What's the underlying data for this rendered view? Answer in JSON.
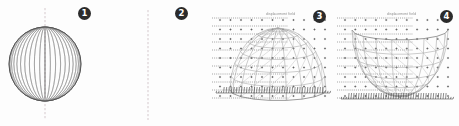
{
  "figure": {
    "title": "Four-panel geometry figure: spheres and mesh surfaces",
    "background_color": "#fdfdfd",
    "line_color": "#8a8a8a",
    "dark_line_color": "#4a4a4a",
    "axis_color": "#b5a9ad",
    "badge_color": "#2b2b2b",
    "badge_text_color": "#ffffff",
    "width": 459,
    "height": 126
  },
  "panels": [
    {
      "number": "1",
      "badge_label": "❶",
      "name": "sphere-meridians",
      "description": "Sphere drawn with vertical meridian (longitude) lines and a dashed vertical polar axis",
      "geometry": {
        "type": "sphere-meridians",
        "center_x": 45,
        "center_y": 64,
        "radius_x": 36,
        "radius_y": 37,
        "meridian_count": 21,
        "axis_dashed": true,
        "axis_top": 8,
        "axis_bottom": 120
      }
    },
    {
      "number": "2",
      "badge_label": "❷",
      "name": "sphere-latitude-rings",
      "description": "Sphere formed by a stack of horizontal latitude ellipses with a dashed vertical polar axis",
      "geometry": {
        "type": "sphere-latitudes",
        "center_x": 148,
        "center_y": 64,
        "radius_x": 38,
        "radius_y": 37,
        "ring_count": 13,
        "axis_dashed": true,
        "axis_top": 10,
        "axis_bottom": 120
      }
    },
    {
      "number": "3",
      "badge_label": "❸",
      "name": "dome-mesh-surface",
      "description": "Hemispherical dome mesh over a dotted sample grid with tick comb along the base and dashed rulings at left",
      "annotation": "displacement field",
      "geometry": {
        "type": "dome-mesh",
        "origin_x": 216,
        "origin_y": 106,
        "width": 118,
        "height": 96,
        "dome_center_x": 278,
        "dome_base_y": 104,
        "dome_radius_x": 48,
        "dome_radius_y": 62,
        "grid_cols": 11,
        "grid_rows": 9,
        "marker": "plus",
        "base_ticks": 46,
        "left_rule_rows": 11
      }
    },
    {
      "number": "4",
      "badge_label": "❹",
      "name": "bowl-mesh-surface",
      "description": "Inverted dome (bowl) mesh over a dotted sample grid with tick comb along the base and dashed rulings at left",
      "annotation": "displacement field",
      "geometry": {
        "type": "bowl-mesh",
        "origin_x": 340,
        "origin_y": 106,
        "width": 116,
        "height": 96,
        "bowl_center_x": 400,
        "bowl_rim_y": 30,
        "bowl_radius_x": 48,
        "bowl_radius_y": 66,
        "grid_cols": 11,
        "grid_rows": 9,
        "marker": "plus",
        "base_ticks": 46,
        "left_rule_rows": 11
      }
    }
  ]
}
